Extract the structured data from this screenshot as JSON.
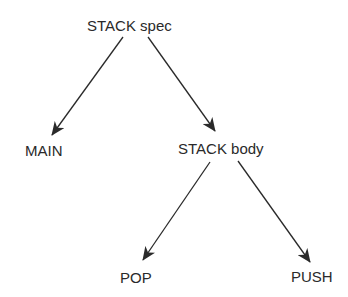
{
  "diagram": {
    "type": "tree",
    "nodes": [
      {
        "id": "stack_spec",
        "label": "STACK spec"
      },
      {
        "id": "main",
        "label": "MAIN"
      },
      {
        "id": "stack_body",
        "label": "STACK body"
      },
      {
        "id": "pop",
        "label": "POP"
      },
      {
        "id": "push",
        "label": "PUSH"
      }
    ],
    "edges": [
      {
        "from": "stack_spec",
        "to": "main"
      },
      {
        "from": "stack_spec",
        "to": "stack_body"
      },
      {
        "from": "stack_body",
        "to": "pop"
      },
      {
        "from": "stack_body",
        "to": "push"
      }
    ],
    "colors": {
      "line": "#2a2a2a",
      "text": "#2a2a2a",
      "background": "#ffffff"
    }
  }
}
